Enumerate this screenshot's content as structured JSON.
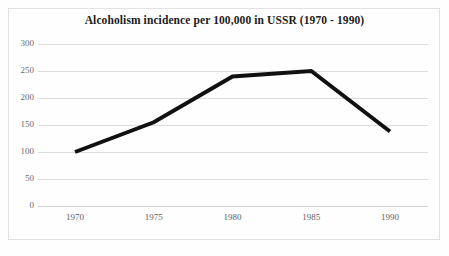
{
  "chart_data": {
    "type": "line",
    "title": "Alcoholism incidence per 100,000 in USSR (1970 - 1990)",
    "xlabel": "",
    "ylabel": "",
    "categories": [
      "1970",
      "1975",
      "1980",
      "1985",
      "1990"
    ],
    "x": [
      1970,
      1975,
      1980,
      1985,
      1990
    ],
    "values": [
      100,
      155,
      240,
      250,
      138
    ],
    "series": [
      {
        "name": "Alcoholism incidence per 100,000",
        "values": [
          100,
          155,
          240,
          250,
          138
        ],
        "color": "#111111"
      }
    ],
    "ylim": [
      0,
      300
    ],
    "xlim": [
      1970,
      1990
    ],
    "yticks": [
      0,
      50,
      100,
      150,
      200,
      250,
      300
    ],
    "ytick_labels": [
      "0",
      "50",
      "100",
      "150",
      "200",
      "250",
      "300"
    ],
    "xticks": [
      1970,
      1975,
      1980,
      1985,
      1990
    ],
    "xtick_labels": [
      "1970",
      "1975",
      "1980",
      "1985",
      "1990"
    ],
    "grid": "horizontal",
    "legend": "none",
    "annotations": []
  },
  "colors": {
    "line": "#111111",
    "gridline": "#dcdcdc",
    "frame": "#e2e2e2",
    "title_text": "#1b1b1b",
    "tick_text": "#6b6b6b",
    "background": "#fefefe"
  }
}
